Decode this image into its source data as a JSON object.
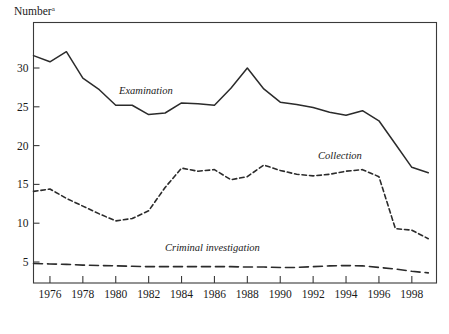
{
  "chart_data": {
    "type": "line",
    "title": "",
    "ylabel": "Number",
    "ylabel_superscript": "a",
    "xlabel": "",
    "grid": false,
    "legend_position": "inline-labels",
    "xlim": [
      1975,
      1999.5
    ],
    "ylim": [
      0,
      33.5
    ],
    "yticks": [
      5,
      10,
      15,
      20,
      25,
      30
    ],
    "ytick_labels": [
      "5",
      "10",
      "15",
      "20",
      "25",
      "30"
    ],
    "xticks": [
      1976,
      1978,
      1980,
      1982,
      1984,
      1986,
      1988,
      1990,
      1992,
      1994,
      1996,
      1998
    ],
    "xtick_labels": [
      "1976",
      "1978",
      "1980",
      "1982",
      "1984",
      "1986",
      "1988",
      "1990",
      "1992",
      "1994",
      "1996",
      "1998"
    ],
    "x": [
      1975,
      1976,
      1977,
      1978,
      1979,
      1980,
      1981,
      1982,
      1983,
      1984,
      1985,
      1986,
      1987,
      1988,
      1989,
      1990,
      1991,
      1992,
      1993,
      1994,
      1995,
      1996,
      1997,
      1998,
      1999
    ],
    "series": [
      {
        "name": "Examination",
        "label": "Examination",
        "style": "solid",
        "color": "#2b2b2b",
        "label_x": 1980.2,
        "label_y": 26.6,
        "values": [
          31.6,
          30.8,
          32.1,
          28.7,
          27.2,
          25.2,
          25.2,
          24.0,
          24.2,
          25.5,
          25.4,
          25.2,
          27.4,
          30.0,
          27.3,
          25.6,
          25.3,
          24.9,
          24.3,
          23.9,
          24.5,
          23.2,
          20.2,
          17.2,
          16.5
        ]
      },
      {
        "name": "Collection",
        "label": "Collection",
        "style": "dotted",
        "color": "#2b2b2b",
        "label_x": 1992.3,
        "label_y": 18.3,
        "values": [
          14.1,
          14.4,
          13.2,
          12.2,
          11.2,
          10.3,
          10.6,
          11.6,
          14.6,
          17.1,
          16.7,
          16.9,
          15.6,
          16.0,
          17.5,
          16.8,
          16.3,
          16.1,
          16.3,
          16.7,
          16.9,
          16.0,
          9.3,
          9.1,
          8.0
        ]
      },
      {
        "name": "Criminal investigation",
        "label": "Criminal investigation",
        "style": "dashed",
        "color": "#2b2b2b",
        "label_x": 1983.0,
        "label_y": 6.4,
        "values": [
          4.8,
          4.75,
          4.7,
          4.6,
          4.55,
          4.5,
          4.45,
          4.4,
          4.4,
          4.4,
          4.4,
          4.4,
          4.4,
          4.35,
          4.35,
          4.3,
          4.3,
          4.4,
          4.5,
          4.55,
          4.5,
          4.3,
          4.1,
          3.8,
          3.6
        ]
      }
    ]
  }
}
